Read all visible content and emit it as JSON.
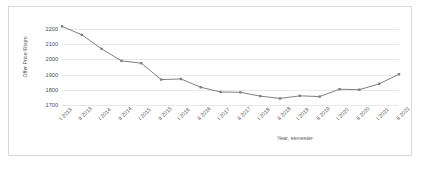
{
  "chart_data": {
    "type": "line",
    "title": "",
    "subtitle": "",
    "xlabel": "Year, semester",
    "ylabel": "Offer Price €/sqm",
    "categories": [
      "I 2013",
      "II 2013",
      "I 2014",
      "II 2014",
      "I 2015",
      "II 2015",
      "I 2016",
      "II 2016",
      "I 2017",
      "II 2017",
      "I 2018",
      "II 2018",
      "I 2019",
      "II 2019",
      "I 2020",
      "II 2020",
      "I 2021",
      "II 2021"
    ],
    "values": [
      2215,
      2160,
      2068,
      1990,
      1975,
      1868,
      1872,
      1818,
      1787,
      1785,
      1760,
      1745,
      1762,
      1757,
      1805,
      1802,
      1840,
      1903
    ],
    "series": [
      {
        "name": "Offer Price",
        "values": [
          2215,
          2160,
          2068,
          1990,
          1975,
          1868,
          1872,
          1818,
          1787,
          1785,
          1760,
          1745,
          1762,
          1757,
          1805,
          1802,
          1840,
          1903
        ]
      }
    ],
    "ylim": [
      1650,
      2250
    ],
    "yticks": [
      1700,
      1800,
      1900,
      2000,
      2100,
      2200
    ],
    "ytick_labels": [
      "1700",
      "1800",
      "1900",
      "2000",
      "2100",
      "2200"
    ],
    "grid": true,
    "grid_axis": "y",
    "legend": false,
    "legend_position": "none",
    "marker": "square",
    "line_color": "#808080",
    "marker_color": "#808080",
    "grid_color": "#e8e8e8",
    "frame_color": "#d9d9d9",
    "background": "#ffffff"
  }
}
